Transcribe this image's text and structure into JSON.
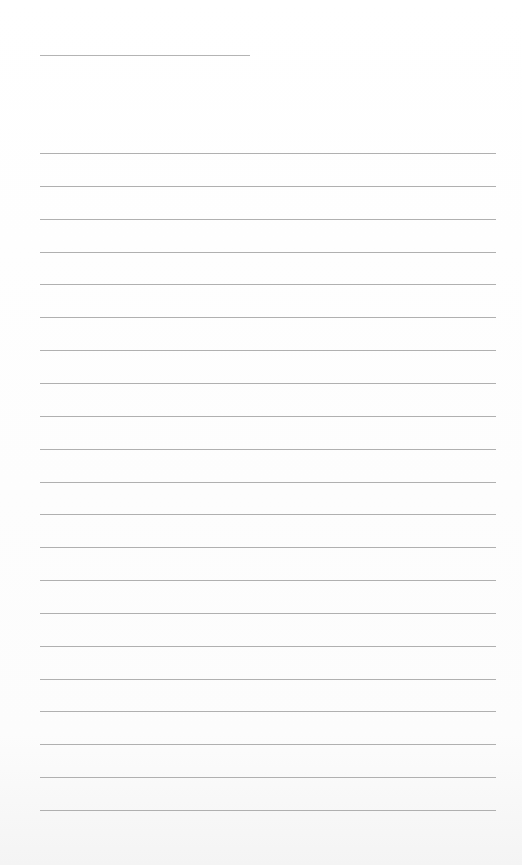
{
  "page": {
    "type": "lined-paper",
    "background_color": "#ffffff",
    "line_color": "#b0b0b0",
    "header_line": {
      "x": 40,
      "y": 55,
      "width": 210
    },
    "ruled_lines": {
      "count": 21,
      "x": 40,
      "width": 456,
      "first_y": 153,
      "spacing": 32.85
    },
    "text": []
  }
}
